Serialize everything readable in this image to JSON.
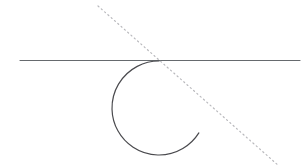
{
  "canvas": {
    "width": 308,
    "height": 166,
    "background": "#ffffff"
  },
  "chart_data": {
    "type": "diagram",
    "xlim": [
      0,
      308
    ],
    "ylim": [
      0,
      166
    ],
    "grid": false,
    "legend": false,
    "elements": [
      {
        "name": "horizontal-line",
        "kind": "line",
        "x1": 20,
        "y1": 60.5,
        "x2": 300,
        "y2": 60.5,
        "stroke": "#666a6e",
        "stroke_width": 1.1,
        "dash": "solid"
      },
      {
        "name": "dotted-transversal-line",
        "kind": "line",
        "x1": 98,
        "y1": 6,
        "x2": 279,
        "y2": 166,
        "stroke": "#b9b9bd",
        "stroke_width": 1.2,
        "dash": "dotted",
        "dash_pattern": "1.2 3.2"
      },
      {
        "name": "open-circle-arc",
        "kind": "arc",
        "cx": 159,
        "cy": 108,
        "r": 47,
        "start_angle_deg": 270,
        "end_angle_deg": 32,
        "sweep": "counterclockwise",
        "stroke": "#4a4a4e",
        "stroke_width": 1.2,
        "fill": "none"
      }
    ],
    "points_of_interest": [
      {
        "name": "tangent-point",
        "x": 159,
        "y": 61
      },
      {
        "name": "arc-open-endpoint",
        "x": 211,
        "y": 101
      }
    ]
  },
  "colors": {
    "solid_line": "#666a6e",
    "dotted_line": "#b9b9bd",
    "arc": "#4a4a4e",
    "background": "#ffffff"
  }
}
